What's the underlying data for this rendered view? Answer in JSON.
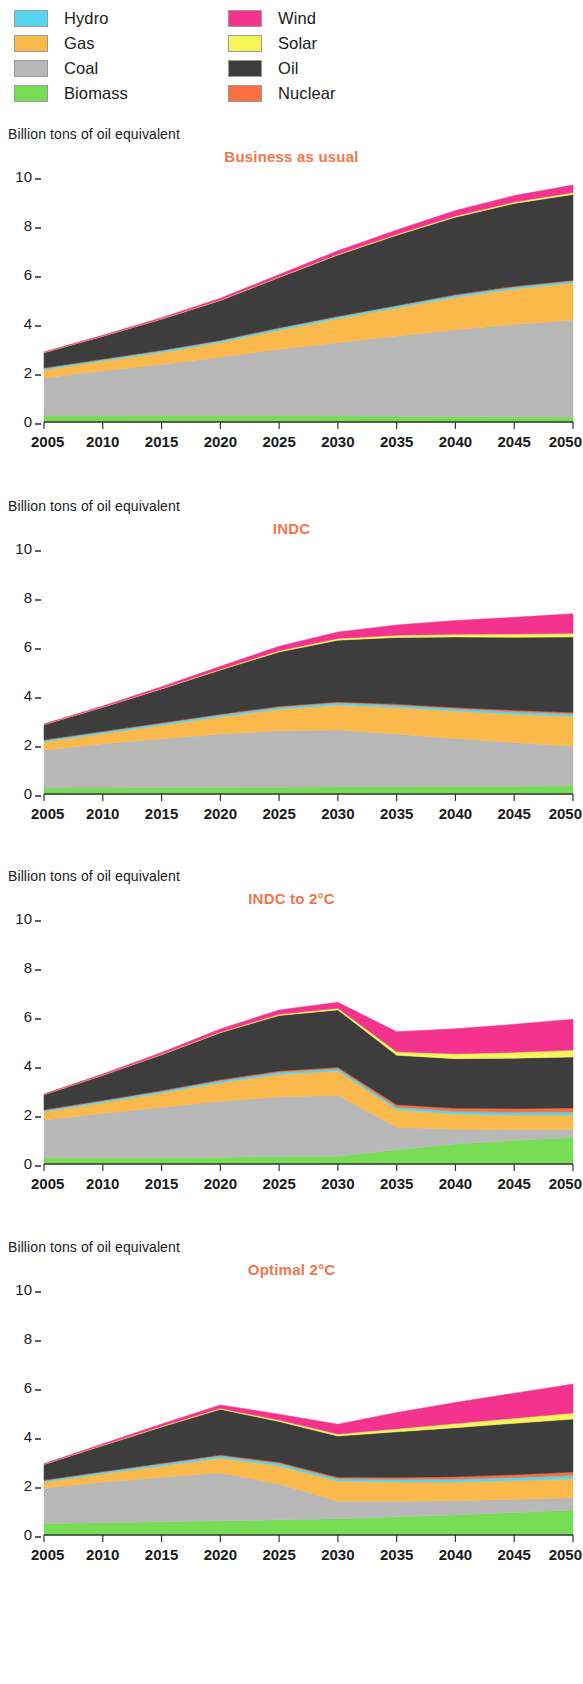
{
  "legend": {
    "columns": [
      [
        {
          "label": "Hydro",
          "key": "hydro",
          "color": "#55d5f0"
        },
        {
          "label": "Gas",
          "key": "gas",
          "color": "#fab94a"
        },
        {
          "label": "Coal",
          "key": "coal",
          "color": "#b8b8b8"
        },
        {
          "label": "Biomass",
          "key": "biomass",
          "color": "#77dd55"
        }
      ],
      [
        {
          "label": "Wind",
          "key": "wind",
          "color": "#f4338f"
        },
        {
          "label": "Solar",
          "key": "solar",
          "color": "#f8f45c"
        },
        {
          "label": "Oil",
          "key": "oil",
          "color": "#3d3d3d"
        },
        {
          "label": "Nuclear",
          "key": "nuclear",
          "color": "#f97040"
        }
      ]
    ]
  },
  "axis_unit_label": "Billion tons of oil equivalent",
  "chart_data": [
    {
      "type": "area",
      "title": "Business as usual",
      "ylabel": "Billion tons of oil equivalent",
      "xlabel": "",
      "stacked": true,
      "grid": false,
      "legend_position": "top",
      "xlim": [
        2005,
        2050
      ],
      "ylim": [
        0,
        10
      ],
      "yticks": [
        0,
        2,
        4,
        6,
        8,
        10
      ],
      "x": [
        2005,
        2010,
        2015,
        2020,
        2025,
        2030,
        2035,
        2040,
        2045,
        2050
      ],
      "categories": [
        "2005",
        "2010",
        "2015",
        "2020",
        "2025",
        "2030",
        "2035",
        "2040",
        "2045",
        "2050"
      ],
      "series": [
        {
          "name": "Biomass",
          "color": "#77dd55",
          "values": [
            0.24,
            0.24,
            0.25,
            0.25,
            0.25,
            0.24,
            0.23,
            0.22,
            0.21,
            0.2
          ]
        },
        {
          "name": "Coal",
          "color": "#b8b8b8",
          "values": [
            1.56,
            1.85,
            2.1,
            2.4,
            2.72,
            3.0,
            3.28,
            3.55,
            3.78,
            3.96
          ]
        },
        {
          "name": "Gas",
          "color": "#fab94a",
          "values": [
            0.33,
            0.4,
            0.49,
            0.6,
            0.78,
            0.98,
            1.15,
            1.32,
            1.44,
            1.52
          ]
        },
        {
          "name": "Hydro",
          "color": "#55d5f0",
          "values": [
            0.06,
            0.06,
            0.07,
            0.07,
            0.08,
            0.08,
            0.08,
            0.08,
            0.08,
            0.08
          ]
        },
        {
          "name": "Nuclear",
          "color": "#f97040",
          "values": [
            0.02,
            0.02,
            0.02,
            0.02,
            0.02,
            0.02,
            0.02,
            0.03,
            0.03,
            0.03
          ]
        },
        {
          "name": "Oil",
          "color": "#3d3d3d",
          "values": [
            0.62,
            0.93,
            1.27,
            1.62,
            2.05,
            2.5,
            2.86,
            3.16,
            3.38,
            3.5
          ]
        },
        {
          "name": "Solar",
          "color": "#f8f45c",
          "values": [
            0.01,
            0.01,
            0.01,
            0.02,
            0.02,
            0.03,
            0.04,
            0.05,
            0.06,
            0.08
          ]
        },
        {
          "name": "Wind",
          "color": "#f4338f",
          "values": [
            0.02,
            0.03,
            0.05,
            0.07,
            0.1,
            0.14,
            0.18,
            0.22,
            0.26,
            0.3
          ]
        }
      ],
      "totals": [
        2.86,
        3.54,
        4.26,
        5.05,
        6.02,
        6.99,
        7.84,
        8.63,
        9.24,
        9.67
      ]
    },
    {
      "type": "area",
      "title": "INDC",
      "ylabel": "Billion tons of oil equivalent",
      "xlabel": "",
      "stacked": true,
      "grid": false,
      "legend_position": "top",
      "xlim": [
        2005,
        2050
      ],
      "ylim": [
        0,
        10
      ],
      "yticks": [
        0,
        2,
        4,
        6,
        8,
        10
      ],
      "x": [
        2005,
        2010,
        2015,
        2020,
        2025,
        2030,
        2035,
        2040,
        2045,
        2050
      ],
      "categories": [
        "2005",
        "2010",
        "2015",
        "2020",
        "2025",
        "2030",
        "2035",
        "2040",
        "2045",
        "2050"
      ],
      "series": [
        {
          "name": "Biomass",
          "color": "#77dd55",
          "values": [
            0.24,
            0.25,
            0.26,
            0.27,
            0.28,
            0.29,
            0.3,
            0.31,
            0.32,
            0.33
          ]
        },
        {
          "name": "Coal",
          "color": "#b8b8b8",
          "values": [
            1.56,
            1.8,
            2.0,
            2.18,
            2.3,
            2.32,
            2.15,
            1.96,
            1.78,
            1.62
          ]
        },
        {
          "name": "Gas",
          "color": "#fab94a",
          "values": [
            0.33,
            0.42,
            0.55,
            0.7,
            0.88,
            1.02,
            1.08,
            1.12,
            1.16,
            1.22
          ]
        },
        {
          "name": "Hydro",
          "color": "#55d5f0",
          "values": [
            0.06,
            0.07,
            0.07,
            0.08,
            0.08,
            0.09,
            0.09,
            0.09,
            0.1,
            0.1
          ]
        },
        {
          "name": "Nuclear",
          "color": "#f97040",
          "values": [
            0.02,
            0.02,
            0.03,
            0.03,
            0.04,
            0.04,
            0.05,
            0.05,
            0.06,
            0.06
          ]
        },
        {
          "name": "Oil",
          "color": "#3d3d3d",
          "values": [
            0.62,
            0.98,
            1.38,
            1.8,
            2.22,
            2.52,
            2.72,
            2.88,
            2.98,
            3.08
          ]
        },
        {
          "name": "Solar",
          "color": "#f8f45c",
          "values": [
            0.01,
            0.01,
            0.02,
            0.03,
            0.05,
            0.07,
            0.09,
            0.11,
            0.13,
            0.15
          ]
        },
        {
          "name": "Wind",
          "color": "#f4338f",
          "values": [
            0.02,
            0.04,
            0.07,
            0.12,
            0.18,
            0.26,
            0.42,
            0.56,
            0.68,
            0.8
          ]
        }
      ],
      "totals": [
        2.86,
        3.59,
        4.38,
        5.21,
        6.03,
        6.61,
        6.9,
        7.08,
        7.21,
        7.36
      ]
    },
    {
      "type": "area",
      "title": "INDC to 2°C",
      "ylabel": "Billion tons of oil equivalent",
      "xlabel": "",
      "stacked": true,
      "grid": false,
      "legend_position": "top",
      "xlim": [
        2005,
        2050
      ],
      "ylim": [
        0,
        10
      ],
      "yticks": [
        0,
        2,
        4,
        6,
        8,
        10
      ],
      "x": [
        2005,
        2010,
        2015,
        2020,
        2025,
        2030,
        2035,
        2040,
        2045,
        2050
      ],
      "categories": [
        "2005",
        "2010",
        "2015",
        "2020",
        "2025",
        "2030",
        "2035",
        "2040",
        "2045",
        "2050"
      ],
      "series": [
        {
          "name": "Biomass",
          "color": "#77dd55",
          "values": [
            0.24,
            0.25,
            0.26,
            0.28,
            0.3,
            0.32,
            0.58,
            0.82,
            0.96,
            1.08
          ]
        },
        {
          "name": "Coal",
          "color": "#b8b8b8",
          "values": [
            1.56,
            1.82,
            2.06,
            2.28,
            2.44,
            2.48,
            0.92,
            0.6,
            0.44,
            0.34
          ]
        },
        {
          "name": "Gas",
          "color": "#fab94a",
          "values": [
            0.33,
            0.44,
            0.58,
            0.76,
            0.92,
            1.0,
            0.72,
            0.62,
            0.6,
            0.58
          ]
        },
        {
          "name": "Hydro",
          "color": "#55d5f0",
          "values": [
            0.06,
            0.07,
            0.07,
            0.08,
            0.09,
            0.09,
            0.1,
            0.11,
            0.11,
            0.12
          ]
        },
        {
          "name": "Nuclear",
          "color": "#f97040",
          "values": [
            0.02,
            0.02,
            0.03,
            0.04,
            0.05,
            0.06,
            0.1,
            0.13,
            0.15,
            0.17
          ]
        },
        {
          "name": "Oil",
          "color": "#3d3d3d",
          "values": [
            0.62,
            1.02,
            1.46,
            1.92,
            2.26,
            2.34,
            2.02,
            2.02,
            2.06,
            2.08
          ]
        },
        {
          "name": "Solar",
          "color": "#f8f45c",
          "values": [
            0.01,
            0.01,
            0.02,
            0.03,
            0.05,
            0.07,
            0.14,
            0.2,
            0.24,
            0.28
          ]
        },
        {
          "name": "Wind",
          "color": "#f4338f",
          "values": [
            0.02,
            0.04,
            0.07,
            0.12,
            0.18,
            0.24,
            0.82,
            1.02,
            1.14,
            1.26
          ]
        }
      ],
      "totals": [
        2.86,
        3.67,
        4.55,
        5.51,
        6.29,
        6.6,
        5.4,
        5.52,
        5.7,
        5.91
      ]
    },
    {
      "type": "area",
      "title": "Optimal 2°C",
      "ylabel": "Billion tons of oil equivalent",
      "xlabel": "",
      "stacked": true,
      "grid": false,
      "legend_position": "top",
      "xlim": [
        2005,
        2050
      ],
      "ylim": [
        0,
        10
      ],
      "yticks": [
        0,
        2,
        4,
        6,
        8,
        10
      ],
      "x": [
        2005,
        2010,
        2015,
        2020,
        2025,
        2030,
        2035,
        2040,
        2045,
        2050
      ],
      "categories": [
        "2005",
        "2010",
        "2015",
        "2020",
        "2025",
        "2030",
        "2035",
        "2040",
        "2045",
        "2050"
      ],
      "series": [
        {
          "name": "Biomass",
          "color": "#77dd55",
          "values": [
            0.46,
            0.5,
            0.54,
            0.58,
            0.62,
            0.66,
            0.74,
            0.82,
            0.92,
            1.02
          ]
        },
        {
          "name": "Coal",
          "color": "#b8b8b8",
          "values": [
            1.46,
            1.66,
            1.82,
            1.96,
            1.46,
            0.72,
            0.64,
            0.58,
            0.54,
            0.5
          ]
        },
        {
          "name": "Gas",
          "color": "#fab94a",
          "values": [
            0.24,
            0.34,
            0.46,
            0.6,
            0.74,
            0.82,
            0.78,
            0.76,
            0.76,
            0.78
          ]
        },
        {
          "name": "Hydro",
          "color": "#55d5f0",
          "values": [
            0.06,
            0.07,
            0.08,
            0.09,
            0.1,
            0.1,
            0.11,
            0.12,
            0.12,
            0.13
          ]
        },
        {
          "name": "Nuclear",
          "color": "#f97040",
          "values": [
            0.02,
            0.02,
            0.03,
            0.04,
            0.05,
            0.06,
            0.08,
            0.1,
            0.12,
            0.14
          ]
        },
        {
          "name": "Oil",
          "color": "#3d3d3d",
          "values": [
            0.64,
            1.06,
            1.48,
            1.86,
            1.66,
            1.68,
            1.86,
            2.0,
            2.1,
            2.16
          ]
        },
        {
          "name": "Solar",
          "color": "#f8f45c",
          "values": [
            0.01,
            0.02,
            0.03,
            0.04,
            0.06,
            0.08,
            0.13,
            0.17,
            0.21,
            0.25
          ]
        },
        {
          "name": "Wind",
          "color": "#f4338f",
          "values": [
            0.02,
            0.05,
            0.09,
            0.14,
            0.24,
            0.4,
            0.66,
            0.86,
            1.02,
            1.18
          ]
        }
      ],
      "totals": [
        2.91,
        3.72,
        4.53,
        5.31,
        4.93,
        4.52,
        5.0,
        5.41,
        5.79,
        6.16
      ]
    }
  ]
}
